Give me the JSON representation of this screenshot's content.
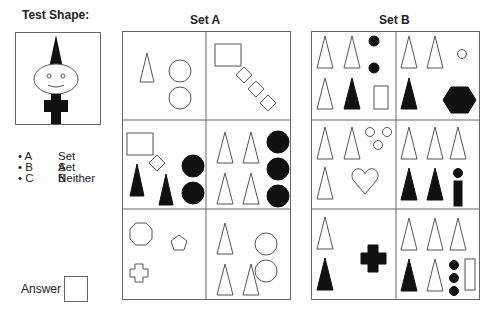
{
  "test_shape": {
    "title": "Test Shape:"
  },
  "set_a": {
    "title": "Set A"
  },
  "set_b": {
    "title": "Set B"
  },
  "options": [
    {
      "key": "A",
      "label": "Set A"
    },
    {
      "key": "B",
      "label": "Set B"
    },
    {
      "key": "C",
      "label": "Neither"
    }
  ],
  "answer": {
    "label": "Answer",
    "value": ""
  },
  "colors": {
    "stroke": "#555555",
    "fill": "#111111",
    "border": "#666666"
  }
}
